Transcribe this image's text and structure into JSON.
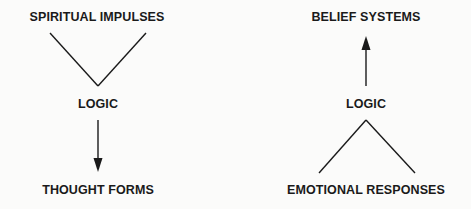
{
  "diagram": {
    "left": {
      "top_label": "SPIRITUAL IMPULSES",
      "middle_label": "LOGIC",
      "bottom_label": "THOUGHT FORMS",
      "connector_top": "converging-v",
      "arrow_direction": "down"
    },
    "right": {
      "top_label": "BELIEF SYSTEMS",
      "middle_label": "LOGIC",
      "bottom_label": "EMOTIONAL RESPONSES",
      "connector_bottom": "diverging-lambda",
      "arrow_direction": "up"
    },
    "colors": {
      "ink": "#1a1a1a",
      "background": "#fbfbfa"
    }
  }
}
